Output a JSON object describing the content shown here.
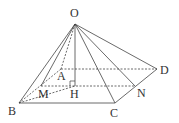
{
  "diagram": {
    "type": "square-pyramid",
    "colors": {
      "line": "#444444",
      "text": "#333333",
      "background": "#ffffff"
    },
    "points": {
      "O": {
        "label": "O",
        "x": 75,
        "y": 24,
        "lx": 70,
        "ly": 17
      },
      "A": {
        "label": "A",
        "x": 61,
        "y": 69,
        "lx": 57,
        "ly": 80
      },
      "B": {
        "label": "B",
        "x": 19,
        "y": 103,
        "lx": 8,
        "ly": 115
      },
      "C": {
        "label": "C",
        "x": 115,
        "y": 103,
        "lx": 110,
        "ly": 117
      },
      "D": {
        "label": "D",
        "x": 157,
        "y": 69,
        "lx": 160,
        "ly": 74
      },
      "M": {
        "label": "M",
        "x": 41,
        "y": 86,
        "lx": 38,
        "ly": 98
      },
      "H": {
        "label": "H",
        "x": 75,
        "y": 86,
        "lx": 70,
        "ly": 98
      },
      "N": {
        "label": "N",
        "x": 135,
        "y": 86,
        "lx": 137,
        "ly": 97
      }
    },
    "solid_edges": [
      [
        "O",
        "B"
      ],
      [
        "O",
        "M"
      ],
      [
        "O",
        "H"
      ],
      [
        "O",
        "C"
      ],
      [
        "O",
        "N"
      ],
      [
        "O",
        "D"
      ],
      [
        "B",
        "C"
      ],
      [
        "C",
        "D"
      ]
    ],
    "dashed_edges": [
      [
        "O",
        "A"
      ],
      [
        "A",
        "B"
      ],
      [
        "A",
        "D"
      ],
      [
        "M",
        "N"
      ],
      [
        "B",
        "H"
      ]
    ],
    "right_angle_at": "H"
  }
}
